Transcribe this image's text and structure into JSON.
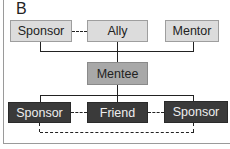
{
  "panel_label": "B",
  "top_row": [
    {
      "label": "Sponsor",
      "style": "light"
    },
    {
      "label": "Ally",
      "style": "light"
    },
    {
      "label": "Mentor",
      "style": "light"
    }
  ],
  "center": {
    "label": "Mentee",
    "style": "mid"
  },
  "bottom_row": [
    {
      "label": "Sponsor",
      "style": "dark"
    },
    {
      "label": "Friend",
      "style": "dark"
    },
    {
      "label": "Sponsor",
      "style": "dark"
    }
  ],
  "connections": {
    "solid": [
      "top_row -> Mentee",
      "Mentee -> bottom_row"
    ],
    "dashed": [
      "Sponsor(top) - Ally",
      "Sponsor(bottom-left) - Friend",
      "Friend - Sponsor(bottom-right)",
      "Sponsor(bottom-left) - Sponsor(bottom-right)"
    ]
  }
}
